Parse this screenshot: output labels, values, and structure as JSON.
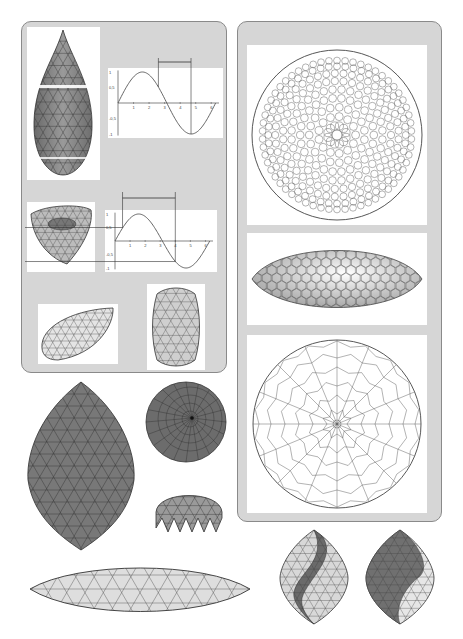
{
  "figure": {
    "panels": {
      "left": {
        "label": "parametrized-shapes-panel"
      },
      "right": {
        "label": "spherical-tilings-panel"
      }
    },
    "colors": {
      "panel_fill": "#d6d6d6",
      "panel_border": "#8a8a8a",
      "mesh_dark": "#5a5a5a",
      "mesh_mid": "#8c8c8c",
      "mesh_light": "#c8c8c8",
      "line": "#333333"
    },
    "shapes": [
      "teardrop-mesh",
      "torus-section-mesh",
      "egg-mesh",
      "barrel-mesh",
      "hexagon-sphere-top",
      "hexagon-ellipsoid",
      "voronoi-sphere",
      "lemon-mesh",
      "sphere-mesh",
      "dome-mesh",
      "spindle-mesh",
      "twisted-band-lemon-1",
      "twisted-band-lemon-2"
    ]
  },
  "chart_data": [
    {
      "type": "line",
      "title": "",
      "xlabel": "",
      "ylabel": "",
      "series": [
        {
          "name": "sin(x)",
          "function": "sin",
          "x_range": [
            0,
            6.28
          ]
        }
      ],
      "xticks": [
        "1",
        "2",
        "3",
        "4",
        "5",
        "6"
      ],
      "yticks": [
        "1",
        "0,5",
        "-0,5",
        "-1"
      ],
      "xlim": [
        0,
        6.5
      ],
      "ylim": [
        -1,
        1
      ],
      "markers": {
        "x_start": 2.6,
        "x_end": 4.7
      },
      "grid": false
    },
    {
      "type": "line",
      "title": "",
      "xlabel": "",
      "ylabel": "",
      "series": [
        {
          "name": "sin(x)",
          "function": "sin",
          "x_range": [
            0,
            6.28
          ]
        }
      ],
      "xticks": [
        "1",
        "2",
        "3",
        "4",
        "5",
        "6"
      ],
      "yticks": [
        "1",
        "0,5",
        "-0,5",
        "-1"
      ],
      "xlim": [
        0,
        6.5
      ],
      "ylim": [
        -1,
        1
      ],
      "markers": {
        "x_start": 0.5,
        "x_end": 4.0,
        "y_levels": [
          0.5,
          -0.76
        ]
      },
      "grid": false
    }
  ]
}
